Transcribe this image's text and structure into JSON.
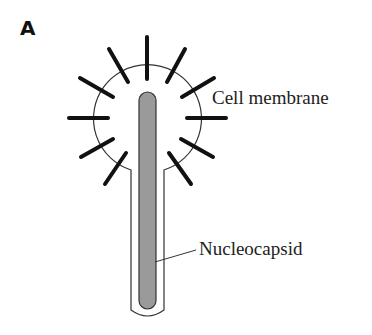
{
  "figure": {
    "panel_label": "A",
    "labels": {
      "cell_membrane": "Cell membrane",
      "nucleocapsid": "Nucleocapsid"
    },
    "colors": {
      "outline": "#333333",
      "spike": "#111111",
      "nucleocapsid_fill": "#9a9a9a",
      "background": "#ffffff"
    },
    "spike_count": 10
  }
}
